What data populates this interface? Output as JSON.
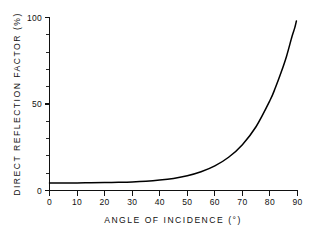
{
  "chart_data": {
    "type": "line",
    "title": "",
    "xlabel": "ANGLE OF INCIDENCE (°)",
    "ylabel": "DIRECT REFLECTION FACTOR (%)",
    "xlim": [
      0,
      90
    ],
    "ylim": [
      0,
      100
    ],
    "grid": false,
    "legend": null,
    "x_ticks": [
      0,
      10,
      20,
      30,
      40,
      50,
      60,
      70,
      80,
      90
    ],
    "x_tick_labels": [
      "0",
      "10",
      "20",
      "30",
      "40",
      "50",
      "60",
      "70",
      "80",
      "90"
    ],
    "y_ticks": [
      0,
      50,
      100
    ],
    "y_tick_labels": [
      "0",
      "50",
      "100"
    ],
    "y_minor_ticks": [
      10,
      20,
      30,
      40,
      60,
      70,
      80,
      90
    ],
    "series": [
      {
        "name": "Direct reflection factor",
        "color": "#000000",
        "x": [
          0,
          5,
          10,
          15,
          20,
          25,
          30,
          35,
          40,
          45,
          50,
          55,
          60,
          65,
          70,
          75,
          80,
          82,
          84,
          86,
          88,
          89,
          89.6
        ],
        "y": [
          4.4,
          4.4,
          4.4,
          4.5,
          4.6,
          4.7,
          4.9,
          5.3,
          6.0,
          7.0,
          8.5,
          10.8,
          14.2,
          19.2,
          26.5,
          37.0,
          52.0,
          59.5,
          68.0,
          77.5,
          89.0,
          94.0,
          98.0
        ]
      }
    ]
  },
  "axes": {
    "y_axis_name": "y-axis",
    "x_axis_name": "x-axis"
  }
}
